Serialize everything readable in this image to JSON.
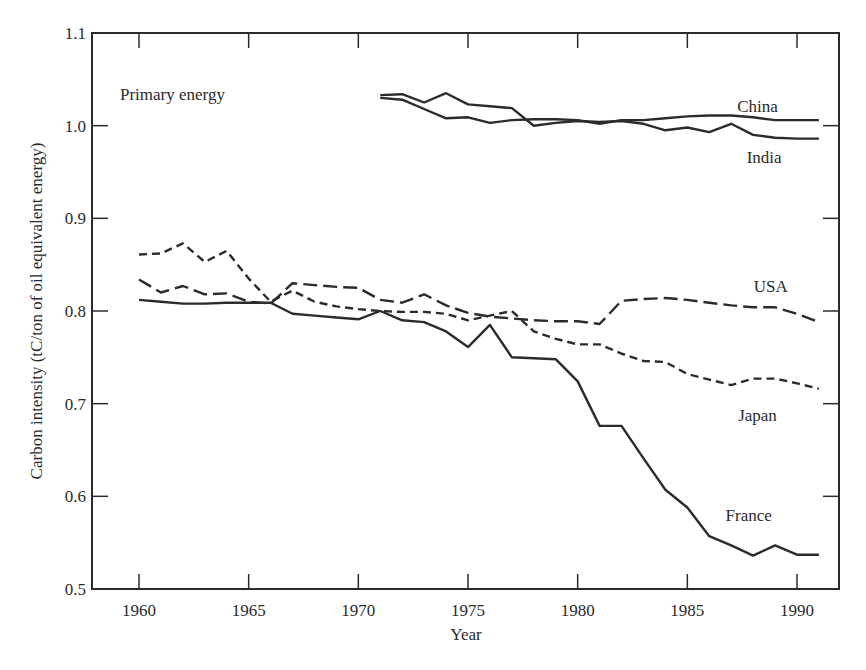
{
  "chart_data": {
    "type": "line",
    "title": "",
    "annotation": "Primary energy",
    "xlabel": "Year",
    "ylabel": "Carbon intensity (tC/ton of oil equivalent energy)",
    "xlim": [
      1957.9,
      1992.1
    ],
    "ylim": [
      0.5,
      1.1
    ],
    "xticks": [
      1960,
      1965,
      1970,
      1975,
      1980,
      1985,
      1990
    ],
    "xtick_labels": [
      "1960",
      "1965",
      "1970",
      "1975",
      "1980",
      "1985",
      "1990"
    ],
    "yticks": [
      0.5,
      0.6,
      0.7,
      0.8,
      0.9,
      1.0,
      1.1
    ],
    "ytick_labels": [
      "0.5",
      "0.6",
      "0.7",
      "0.8",
      "0.9",
      "1.0",
      "1.1"
    ],
    "grid": false,
    "legend": "inline labels at right end of each series",
    "series": [
      {
        "name": "China",
        "style": "solid",
        "x": [
          1971,
          1972,
          1973,
          1974,
          1975,
          1976,
          1977,
          1978,
          1979,
          1980,
          1981,
          1982,
          1983,
          1984,
          1985,
          1986,
          1987,
          1988,
          1989,
          1990,
          1991
        ],
        "values": [
          1.03,
          1.028,
          1.018,
          1.008,
          1.009,
          1.003,
          1.006,
          1.007,
          1.007,
          1.006,
          1.002,
          1.006,
          1.006,
          1.008,
          1.01,
          1.011,
          1.011,
          1.009,
          1.006,
          1.006,
          1.006
        ]
      },
      {
        "name": "India",
        "style": "solid",
        "x": [
          1971,
          1972,
          1973,
          1974,
          1975,
          1976,
          1977,
          1978,
          1979,
          1980,
          1981,
          1982,
          1983,
          1984,
          1985,
          1986,
          1987,
          1988,
          1989,
          1990,
          1991
        ],
        "values": [
          1.033,
          1.034,
          1.025,
          1.035,
          1.023,
          1.021,
          1.019,
          1.0,
          1.003,
          1.005,
          1.004,
          1.005,
          1.002,
          0.995,
          0.998,
          0.993,
          1.002,
          0.99,
          0.987,
          0.986,
          0.986
        ]
      },
      {
        "name": "USA",
        "style": "long-dash",
        "x": [
          1960,
          1961,
          1962,
          1963,
          1964,
          1965,
          1966,
          1967,
          1968,
          1969,
          1970,
          1971,
          1972,
          1973,
          1974,
          1975,
          1976,
          1977,
          1978,
          1979,
          1980,
          1981,
          1982,
          1983,
          1984,
          1985,
          1986,
          1987,
          1988,
          1989,
          1990,
          1991
        ],
        "values": [
          0.834,
          0.82,
          0.827,
          0.818,
          0.819,
          0.81,
          0.808,
          0.83,
          0.828,
          0.826,
          0.825,
          0.812,
          0.809,
          0.818,
          0.806,
          0.798,
          0.794,
          0.792,
          0.79,
          0.789,
          0.789,
          0.786,
          0.811,
          0.813,
          0.814,
          0.812,
          0.809,
          0.806,
          0.804,
          0.804,
          0.797,
          0.788
        ]
      },
      {
        "name": "Japan",
        "style": "short-dash",
        "x": [
          1960,
          1961,
          1962,
          1963,
          1964,
          1965,
          1966,
          1967,
          1968,
          1969,
          1970,
          1971,
          1972,
          1973,
          1974,
          1975,
          1976,
          1977,
          1978,
          1979,
          1980,
          1981,
          1982,
          1983,
          1984,
          1985,
          1986,
          1987,
          1988,
          1989,
          1990,
          1991
        ],
        "values": [
          0.861,
          0.862,
          0.873,
          0.853,
          0.865,
          0.835,
          0.81,
          0.822,
          0.81,
          0.805,
          0.802,
          0.8,
          0.799,
          0.799,
          0.797,
          0.79,
          0.795,
          0.8,
          0.778,
          0.77,
          0.764,
          0.764,
          0.754,
          0.746,
          0.745,
          0.732,
          0.726,
          0.72,
          0.727,
          0.727,
          0.722,
          0.716
        ]
      },
      {
        "name": "France",
        "style": "solid",
        "x": [
          1960,
          1961,
          1962,
          1963,
          1964,
          1965,
          1966,
          1967,
          1968,
          1969,
          1970,
          1971,
          1972,
          1973,
          1974,
          1975,
          1976,
          1977,
          1978,
          1979,
          1980,
          1981,
          1982,
          1983,
          1984,
          1985,
          1986,
          1987,
          1988,
          1989,
          1990,
          1991
        ],
        "values": [
          0.812,
          0.81,
          0.808,
          0.808,
          0.809,
          0.809,
          0.809,
          0.797,
          0.795,
          0.793,
          0.791,
          0.8,
          0.79,
          0.788,
          0.778,
          0.761,
          0.785,
          0.75,
          0.749,
          0.748,
          0.724,
          0.676,
          0.676,
          0.641,
          0.607,
          0.588,
          0.557,
          0.547,
          0.536,
          0.547,
          0.537,
          0.537
        ]
      }
    ],
    "series_labels": [
      {
        "name": "China",
        "x": 1988.2,
        "y": 1.015
      },
      {
        "name": "India",
        "x": 1988.5,
        "y": 0.96
      },
      {
        "name": "USA",
        "x": 1988.8,
        "y": 0.82
      },
      {
        "name": "Japan",
        "x": 1988.2,
        "y": 0.681
      },
      {
        "name": "France",
        "x": 1987.8,
        "y": 0.573
      }
    ]
  },
  "colors": {
    "line": "#2b2b2b",
    "axis": "#2b2b2b",
    "background": "#ffffff"
  }
}
